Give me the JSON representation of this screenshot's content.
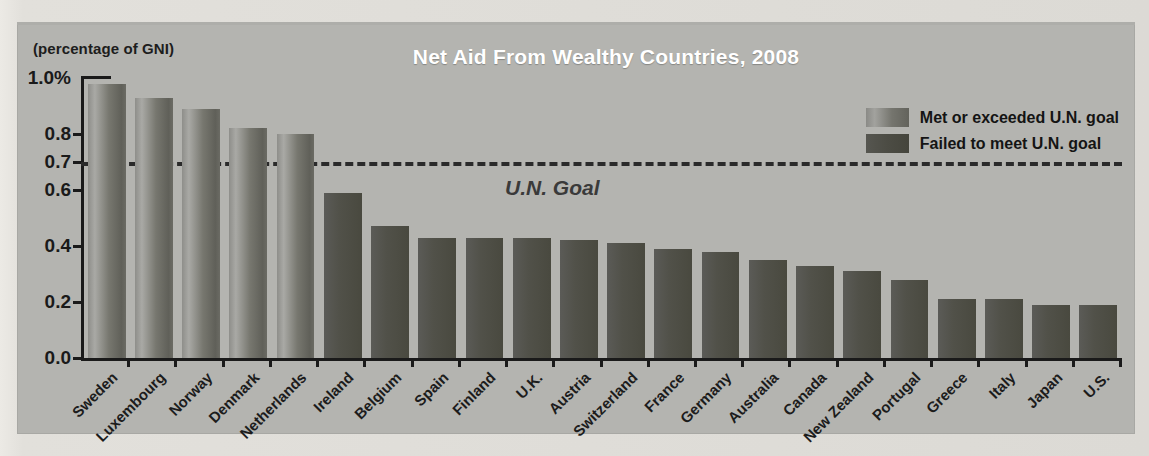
{
  "chart_data": {
    "type": "bar",
    "title": "Net Aid From Wealthy Countries, 2008",
    "axis_note": "(percentage of GNI)",
    "xlabel": "",
    "ylabel": "(percentage of GNI)",
    "ylim": [
      0.0,
      1.0
    ],
    "ytick_labels": [
      "1.0%",
      "0.8",
      "0.7",
      "0.6",
      "0.4",
      "0.2",
      "0.0"
    ],
    "ytick_values": [
      1.0,
      0.8,
      0.7,
      0.6,
      0.4,
      0.2,
      0.0
    ],
    "grid": false,
    "annotation": {
      "text": "U.N. Goal",
      "value": 0.7,
      "style": "dashed-line"
    },
    "legend": {
      "position": "top-right",
      "entries": [
        {
          "label": "Met or exceeded U.N. goal",
          "key": "met"
        },
        {
          "label": "Failed to meet U.N. goal",
          "key": "failed"
        }
      ]
    },
    "categories": [
      "Sweden",
      "Luxembourg",
      "Norway",
      "Denmark",
      "Netherlands",
      "Ireland",
      "Belgium",
      "Spain",
      "Finland",
      "U.K.",
      "Austria",
      "Switzerland",
      "France",
      "Germany",
      "Australia",
      "Canada",
      "New Zealand",
      "Portugal",
      "Greece",
      "Italy",
      "Japan",
      "U.S."
    ],
    "values": [
      0.98,
      0.93,
      0.89,
      0.82,
      0.8,
      0.59,
      0.47,
      0.43,
      0.43,
      0.43,
      0.42,
      0.41,
      0.39,
      0.38,
      0.35,
      0.33,
      0.31,
      0.28,
      0.21,
      0.21,
      0.19,
      0.19
    ],
    "groups": [
      "met",
      "met",
      "met",
      "met",
      "met",
      "failed",
      "failed",
      "failed",
      "failed",
      "failed",
      "failed",
      "failed",
      "failed",
      "failed",
      "failed",
      "failed",
      "failed",
      "failed",
      "failed",
      "failed",
      "failed",
      "failed"
    ],
    "colors": {
      "met": "#8a8a86",
      "failed": "#4c4c44",
      "panel_background": "#b4b4b0",
      "page_background": "#dcdad5",
      "axis": "#1a1a1a",
      "title_text": "#ffffff",
      "goal_line": "#2a2a2a"
    }
  }
}
